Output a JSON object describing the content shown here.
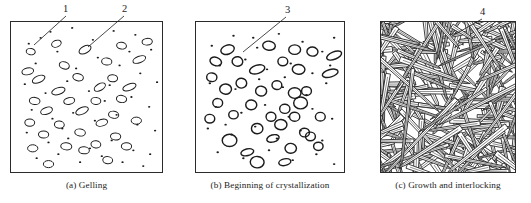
{
  "figure": {
    "title": "",
    "panel_count": 3,
    "background_color": "#ffffff",
    "ink_color": "#1c1c1c",
    "border_color": "#2b2b2b"
  },
  "panels": [
    {
      "id": "panel-a",
      "caption": "(a) Gelling",
      "frame": {
        "x": 10,
        "y": 21,
        "w": 153,
        "h": 152
      },
      "caption_box": {
        "x": 10,
        "y": 180,
        "w": 153
      },
      "description": "sparse small dots and small outlined ellipses",
      "particles": {
        "dots": [
          [
            18,
            22
          ],
          [
            40,
            10
          ],
          [
            62,
            6
          ],
          [
            83,
            18
          ],
          [
            104,
            9
          ],
          [
            126,
            13
          ],
          [
            142,
            28
          ],
          [
            25,
            42
          ],
          [
            47,
            30
          ],
          [
            66,
            47
          ],
          [
            88,
            36
          ],
          [
            110,
            44
          ],
          [
            131,
            52
          ],
          [
            148,
            61
          ],
          [
            14,
            63
          ],
          [
            35,
            72
          ],
          [
            57,
            60
          ],
          [
            79,
            70
          ],
          [
            100,
            64
          ],
          [
            122,
            76
          ],
          [
            140,
            86
          ],
          [
            21,
            89
          ],
          [
            42,
            98
          ],
          [
            63,
            92
          ],
          [
            85,
            100
          ],
          [
            107,
            94
          ],
          [
            128,
            104
          ],
          [
            146,
            110
          ],
          [
            16,
            112
          ],
          [
            38,
            122
          ],
          [
            58,
            118
          ],
          [
            80,
            128
          ],
          [
            102,
            120
          ],
          [
            124,
            130
          ],
          [
            141,
            134
          ],
          [
            26,
            138
          ],
          [
            48,
            134
          ],
          [
            70,
            142
          ],
          [
            92,
            136
          ],
          [
            113,
            142
          ],
          [
            134,
            146
          ],
          [
            30,
            16
          ],
          [
            120,
            30
          ],
          [
            95,
            80
          ],
          [
            52,
            108
          ]
        ],
        "ellipses": [
          [
            20,
            30,
            4.6,
            3.2,
            10
          ],
          [
            46,
            22,
            5.0,
            3.4,
            -20
          ],
          [
            75,
            28,
            6.6,
            3.6,
            -28
          ],
          [
            112,
            24,
            5.0,
            3.4,
            8
          ],
          [
            138,
            20,
            5.2,
            3.4,
            -5
          ],
          [
            17,
            50,
            6.0,
            3.4,
            -12
          ],
          [
            54,
            44,
            5.2,
            3.6,
            18
          ],
          [
            97,
            40,
            5.2,
            3.6,
            6
          ],
          [
            130,
            38,
            6.8,
            3.2,
            -22
          ],
          [
            28,
            58,
            6.8,
            3.4,
            -24
          ],
          [
            68,
            56,
            5.4,
            3.6,
            12
          ],
          [
            103,
            57,
            5.0,
            3.6,
            4
          ],
          [
            48,
            70,
            7.0,
            3.4,
            -18
          ],
          [
            90,
            66,
            6.2,
            3.4,
            -30
          ],
          [
            120,
            66,
            7.0,
            3.2,
            -20
          ],
          [
            24,
            80,
            5.4,
            3.6,
            6
          ],
          [
            59,
            80,
            5.6,
            3.4,
            -12
          ],
          [
            86,
            80,
            5.0,
            3.6,
            4
          ],
          [
            112,
            78,
            5.2,
            3.6,
            10
          ],
          [
            36,
            90,
            6.2,
            3.4,
            -20
          ],
          [
            72,
            90,
            6.8,
            3.4,
            -24
          ],
          [
            104,
            94,
            5.2,
            3.6,
            8
          ],
          [
            19,
            102,
            5.0,
            3.6,
            2
          ],
          [
            49,
            104,
            5.0,
            3.6,
            6
          ],
          [
            92,
            102,
            6.0,
            3.4,
            -16
          ],
          [
            127,
            100,
            5.2,
            3.6,
            0
          ],
          [
            33,
            114,
            5.2,
            3.6,
            2
          ],
          [
            70,
            112,
            5.4,
            3.6,
            8
          ],
          [
            106,
            116,
            5.2,
            3.6,
            4
          ],
          [
            22,
            128,
            5.2,
            3.6,
            0
          ],
          [
            56,
            126,
            5.6,
            3.6,
            6
          ],
          [
            86,
            124,
            5.0,
            3.6,
            8
          ],
          [
            117,
            126,
            5.2,
            3.6,
            2
          ],
          [
            38,
            144,
            5.2,
            3.6,
            0
          ],
          [
            74,
            130,
            5.4,
            3.6,
            4
          ],
          [
            98,
            140,
            5.0,
            3.6,
            6
          ]
        ]
      }
    },
    {
      "id": "panel-b",
      "caption": "(b) Beginning of crystallization",
      "frame": {
        "x": 195,
        "y": 21,
        "w": 150,
        "h": 152
      },
      "caption_box": {
        "x": 185,
        "y": 180,
        "w": 170
      },
      "description": "larger bold outlined ellipses mixed with small dots",
      "particles": {
        "dots": [
          [
            16,
            24
          ],
          [
            38,
            14
          ],
          [
            62,
            26
          ],
          [
            84,
            12
          ],
          [
            108,
            20
          ],
          [
            128,
            30
          ],
          [
            140,
            16
          ],
          [
            24,
            44
          ],
          [
            50,
            38
          ],
          [
            72,
            48
          ],
          [
            96,
            42
          ],
          [
            118,
            52
          ],
          [
            136,
            44
          ],
          [
            14,
            62
          ],
          [
            40,
            68
          ],
          [
            64,
            58
          ],
          [
            88,
            66
          ],
          [
            112,
            74
          ],
          [
            132,
            62
          ],
          [
            20,
            86
          ],
          [
            46,
            92
          ],
          [
            70,
            84
          ],
          [
            94,
            96
          ],
          [
            118,
            88
          ],
          [
            138,
            98
          ],
          [
            12,
            108
          ],
          [
            36,
            114
          ],
          [
            60,
            106
          ],
          [
            82,
            118
          ],
          [
            106,
            110
          ],
          [
            128,
            120
          ],
          [
            22,
            132
          ],
          [
            48,
            138
          ],
          [
            74,
            130
          ],
          [
            98,
            140
          ],
          [
            122,
            134
          ],
          [
            140,
            144
          ],
          [
            58,
            16
          ],
          [
            30,
            104
          ],
          [
            90,
            56
          ]
        ],
        "ellipses": [
          [
            32,
            28,
            7.0,
            4.6,
            -18
          ],
          [
            74,
            24,
            6.4,
            4.6,
            6
          ],
          [
            100,
            28,
            6.0,
            4.8,
            0
          ],
          [
            118,
            30,
            5.6,
            4.6,
            4
          ],
          [
            140,
            34,
            8.0,
            3.8,
            -22
          ],
          [
            20,
            40,
            6.0,
            4.2,
            20
          ],
          [
            42,
            40,
            5.4,
            4.8,
            10
          ],
          [
            88,
            40,
            5.0,
            4.4,
            2
          ],
          [
            62,
            48,
            8.0,
            4.2,
            -18
          ],
          [
            104,
            48,
            6.4,
            5.0,
            4
          ],
          [
            136,
            52,
            8.2,
            3.8,
            -16
          ],
          [
            16,
            56,
            5.2,
            4.4,
            6
          ],
          [
            46,
            62,
            5.4,
            5.0,
            2
          ],
          [
            82,
            64,
            5.0,
            4.4,
            4
          ],
          [
            30,
            68,
            6.0,
            5.2,
            2
          ],
          [
            66,
            70,
            5.6,
            5.0,
            6
          ],
          [
            100,
            72,
            6.4,
            5.4,
            0
          ],
          [
            112,
            70,
            5.0,
            4.4,
            2
          ],
          [
            106,
            82,
            7.0,
            6.0,
            0
          ],
          [
            22,
            82,
            5.0,
            4.4,
            4
          ],
          [
            56,
            84,
            5.6,
            5.0,
            2
          ],
          [
            90,
            88,
            5.2,
            4.6,
            6
          ],
          [
            38,
            94,
            4.8,
            4.2,
            0
          ],
          [
            76,
            96,
            5.0,
            4.6,
            4
          ],
          [
            100,
            96,
            5.2,
            4.6,
            2
          ],
          [
            14,
            98,
            5.0,
            4.4,
            2
          ],
          [
            86,
            104,
            6.2,
            5.2,
            2
          ],
          [
            126,
            96,
            5.0,
            4.4,
            0
          ],
          [
            62,
            108,
            5.8,
            5.2,
            4
          ],
          [
            110,
            112,
            5.0,
            4.4,
            2
          ],
          [
            34,
            120,
            7.4,
            6.2,
            0
          ],
          [
            78,
            118,
            6.4,
            3.6,
            -16
          ],
          [
            116,
            116,
            5.0,
            4.4,
            2
          ],
          [
            52,
            132,
            6.6,
            3.4,
            -14
          ],
          [
            96,
            128,
            5.8,
            5.0,
            2
          ],
          [
            124,
            126,
            4.8,
            4.2,
            0
          ],
          [
            62,
            142,
            7.0,
            5.8,
            2
          ],
          [
            90,
            142,
            6.2,
            3.4,
            -12
          ]
        ]
      }
    },
    {
      "id": "panel-c",
      "caption": "(c) Growth and interlocking",
      "frame": {
        "x": 380,
        "y": 21,
        "w": 136,
        "h": 152
      },
      "caption_box": {
        "x": 370,
        "y": 180,
        "w": 156
      },
      "description": "dense interlocking acicular needle-like crystals"
    }
  ],
  "callouts": [
    {
      "id": "callout-1",
      "label": "1",
      "x": 63,
      "y": 3,
      "line": {
        "x1": 66,
        "y1": 16,
        "x2": 34,
        "y2": 45
      }
    },
    {
      "id": "callout-2",
      "label": "2",
      "x": 122,
      "y": 3,
      "line": {
        "x1": 124,
        "y1": 16,
        "x2": 88,
        "y2": 47
      }
    },
    {
      "id": "callout-3",
      "label": "3",
      "x": 285,
      "y": 4,
      "line": {
        "x1": 286,
        "y1": 17,
        "x2": 243,
        "y2": 52
      }
    },
    {
      "id": "callout-4",
      "label": "4",
      "x": 480,
      "y": 6,
      "line": {
        "x1": 482,
        "y1": 19,
        "x2": 452,
        "y2": 36
      }
    }
  ]
}
